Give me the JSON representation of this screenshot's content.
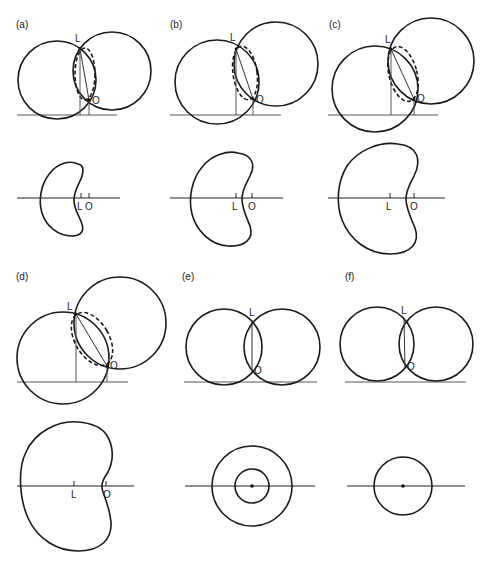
{
  "figure": {
    "panels": [
      {
        "id": "a",
        "label": "(a)",
        "point_L": "L",
        "point_O": "O",
        "bottom_L": "L",
        "bottom_O": "O"
      },
      {
        "id": "b",
        "label": "(b)",
        "point_L": "L",
        "point_O": "O",
        "bottom_L": "L",
        "bottom_O": "O"
      },
      {
        "id": "c",
        "label": "(c)",
        "point_L": "L",
        "point_O": "O",
        "bottom_L": "L",
        "bottom_O": "O"
      },
      {
        "id": "d",
        "label": "(d)",
        "point_L": "L",
        "point_O": "O",
        "bottom_L": "L",
        "bottom_O": "O"
      },
      {
        "id": "e",
        "label": "(e)",
        "point_L": "L",
        "point_O": "O"
      },
      {
        "id": "f",
        "label": "(f)",
        "point_L": "L",
        "point_O": "O"
      }
    ]
  }
}
